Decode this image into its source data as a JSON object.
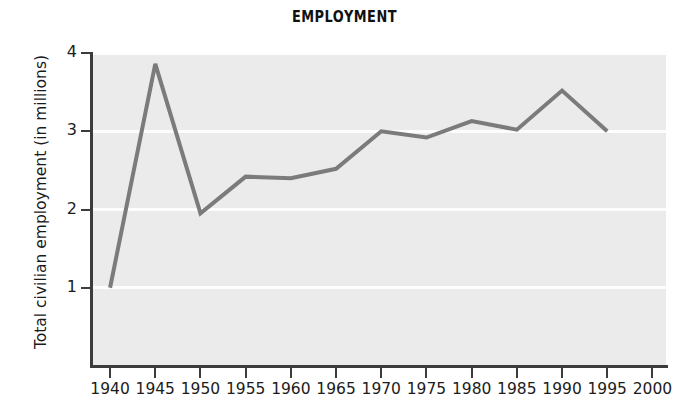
{
  "chart_data": {
    "type": "line",
    "title": "EMPLOYMENT",
    "xlabel": "",
    "ylabel": "Total civilian employment (in millions)",
    "x": [
      1940,
      1945,
      1950,
      1955,
      1960,
      1965,
      1970,
      1975,
      1980,
      1985,
      1990,
      1995
    ],
    "values": [
      1.0,
      3.86,
      1.95,
      2.42,
      2.4,
      2.52,
      3.0,
      2.92,
      3.13,
      3.02,
      3.52,
      3.0
    ],
    "series": [
      {
        "name": "Total civilian employment",
        "values": [
          1.0,
          3.86,
          1.95,
          2.42,
          2.4,
          2.52,
          3.0,
          2.92,
          3.13,
          3.02,
          3.52,
          3.0
        ]
      }
    ],
    "xlim": [
      1938.0,
      2001.5
    ],
    "ylim": [
      0.0,
      4.0
    ],
    "xtick_labels": [
      "1940",
      "1945",
      "1950",
      "1955",
      "1960",
      "1965",
      "1970",
      "1975",
      "1980",
      "1985",
      "1990",
      "1995",
      "2000"
    ],
    "xtick_values": [
      1940,
      1945,
      1950,
      1955,
      1960,
      1965,
      1970,
      1975,
      1980,
      1985,
      1990,
      1995,
      2000
    ],
    "ytick_labels": [
      "1",
      "2",
      "3",
      "4"
    ],
    "ytick_values": [
      1,
      2,
      3,
      4
    ],
    "grid": "horizontal-white-on-gray",
    "legend": "none",
    "colors": {
      "line": "#7b7b7b",
      "plot_background": "#ebebeb",
      "gridline": "#fdfdfd",
      "axis": "#3c3c3c",
      "text": "#1c1c1c",
      "figure_background": "#ffffff"
    },
    "line_width_px": 4
  }
}
